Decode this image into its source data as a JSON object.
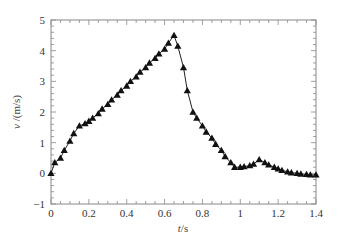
{
  "chart_data": {
    "type": "line",
    "title": "",
    "xlabel": "t /s",
    "xlabel_var": "t",
    "xlabel_unit": "/s",
    "ylabel": "v /(m/s)",
    "ylabel_var": "v",
    "ylabel_unit": "/(m/s)",
    "xlim": [
      0,
      1.4
    ],
    "ylim": [
      -1,
      5
    ],
    "x_ticks": [
      0,
      0.2,
      0.4,
      0.6,
      0.8,
      1,
      1.2,
      1.4
    ],
    "x_tick_labels": [
      "0",
      "0.2",
      "0.4",
      "0.6",
      "0.8",
      "1",
      "1.2",
      "1.4"
    ],
    "y_ticks": [
      -1,
      0,
      1,
      2,
      3,
      4,
      5
    ],
    "y_tick_labels": [
      "−1",
      "0",
      "1",
      "2",
      "3",
      "4",
      "5"
    ],
    "grid": false,
    "legend": null,
    "marker": "triangle",
    "line_color": "#222222",
    "series": [
      {
        "name": "v",
        "x": [
          0.0,
          0.02,
          0.05,
          0.07,
          0.1,
          0.12,
          0.15,
          0.18,
          0.2,
          0.22,
          0.25,
          0.27,
          0.3,
          0.32,
          0.35,
          0.37,
          0.4,
          0.42,
          0.45,
          0.47,
          0.5,
          0.52,
          0.55,
          0.57,
          0.6,
          0.62,
          0.65,
          0.67,
          0.7,
          0.72,
          0.75,
          0.77,
          0.8,
          0.82,
          0.85,
          0.87,
          0.9,
          0.92,
          0.95,
          0.97,
          1.0,
          1.02,
          1.05,
          1.07,
          1.1,
          1.13,
          1.15,
          1.18,
          1.2,
          1.22,
          1.25,
          1.27,
          1.3,
          1.32,
          1.35,
          1.37,
          1.4
        ],
        "y": [
          0.0,
          0.35,
          0.5,
          0.75,
          1.05,
          1.3,
          1.55,
          1.62,
          1.7,
          1.8,
          1.95,
          2.1,
          2.25,
          2.4,
          2.55,
          2.7,
          2.85,
          3.0,
          3.15,
          3.3,
          3.45,
          3.6,
          3.75,
          3.9,
          4.05,
          4.25,
          4.5,
          4.15,
          3.45,
          2.7,
          2.0,
          1.8,
          1.55,
          1.35,
          1.15,
          0.95,
          0.75,
          0.55,
          0.35,
          0.2,
          0.2,
          0.22,
          0.25,
          0.3,
          0.45,
          0.35,
          0.28,
          0.2,
          0.15,
          0.1,
          0.05,
          0.02,
          0.0,
          -0.02,
          -0.03,
          -0.05,
          -0.05
        ]
      }
    ]
  }
}
